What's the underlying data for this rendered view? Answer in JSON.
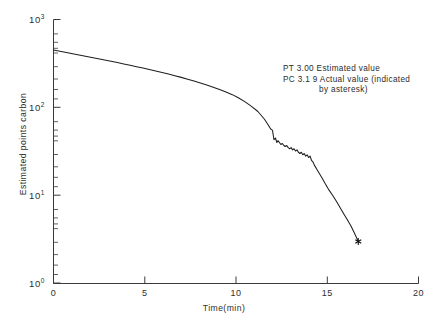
{
  "chart_data": {
    "type": "line",
    "title": "",
    "xlabel": "Time(min)",
    "ylabel": "Estimated points carbon",
    "xlim": [
      0,
      20
    ],
    "ylim": [
      1,
      1000
    ],
    "yscale": "log",
    "xscale": "linear",
    "grid": false,
    "legend_position": "none",
    "x_ticks": [
      0,
      5,
      10,
      15,
      20
    ],
    "x_tick_labels": [
      "0",
      "5",
      "10",
      "15",
      "20"
    ],
    "y_ticks": [
      1,
      10,
      100,
      1000
    ],
    "y_tick_labels": [
      "10⁰",
      "10¹",
      "10²",
      "10³"
    ],
    "y_tick_bases": [
      "10",
      "10",
      "10",
      "10"
    ],
    "y_tick_exponents": [
      "0",
      "1",
      "2",
      "3"
    ],
    "series": [
      {
        "name": "Estimated points carbon",
        "x": [
          0.0,
          0.35,
          0.7,
          1.05,
          1.4,
          1.75,
          2.1,
          2.45,
          2.8,
          3.15,
          3.5,
          3.85,
          4.2,
          4.55,
          4.9,
          5.25,
          5.6,
          5.95,
          6.3,
          6.65,
          7.0,
          7.35,
          7.7,
          8.05,
          8.4,
          8.75,
          9.1,
          9.45,
          9.8,
          10.15,
          10.5,
          10.85,
          11.2,
          11.55,
          11.75,
          11.9,
          11.95,
          12.0,
          12.08,
          12.16,
          12.24,
          12.3,
          12.38,
          12.46,
          12.54,
          12.62,
          12.7,
          12.78,
          12.86,
          12.94,
          13.02,
          13.1,
          13.18,
          13.26,
          13.34,
          13.42,
          13.5,
          13.58,
          13.66,
          13.74,
          13.82,
          13.9,
          13.98,
          14.06,
          14.14,
          14.22,
          14.3,
          14.42,
          14.55,
          14.7,
          14.9,
          15.1,
          15.3,
          15.5,
          15.7,
          15.9,
          16.1,
          16.3,
          16.5,
          16.7
        ],
        "y": [
          450,
          436,
          422,
          409,
          396,
          383,
          371,
          359,
          347,
          336,
          324,
          313,
          302,
          291,
          281,
          270,
          260,
          250,
          240,
          230,
          220,
          210,
          200,
          190,
          180,
          170,
          160,
          150,
          140,
          128,
          116,
          103,
          90,
          74,
          64,
          57,
          56,
          55,
          43,
          45,
          40,
          42,
          40,
          38,
          39,
          37,
          36,
          37,
          35,
          34,
          35,
          33,
          34,
          32,
          33,
          31,
          30,
          31,
          29,
          30,
          28,
          29,
          27,
          28,
          25,
          24,
          22,
          20,
          18,
          16,
          13.5,
          11.5,
          10.0,
          8.6,
          7.3,
          6.2,
          5.3,
          4.5,
          3.7,
          3.0
        ]
      }
    ],
    "markers": [
      {
        "name": "actual-value-asterisk",
        "symbol": "asterisk",
        "x": 16.7,
        "y": 3.0
      }
    ],
    "annotations": [
      {
        "name": "pt-pc-annotation",
        "line1": "PT  3.00 Estimated value",
        "line2": "PC  3.1 9 Actual value (indicated",
        "line3": "by asteresk)"
      }
    ]
  },
  "annotation": {
    "line1": "PT  3.00 Estimated value",
    "line2": "PC  3.1 9 Actual value (indicated",
    "line3": "by asteresk)"
  },
  "axes": {
    "x_title": "Time(min)",
    "y_title": "Estimated points carbon"
  },
  "colors": {
    "background": "#ffffff",
    "curve": "#1e1e1e",
    "axis": "#3a3a3a",
    "text": "#2e2e2e"
  }
}
